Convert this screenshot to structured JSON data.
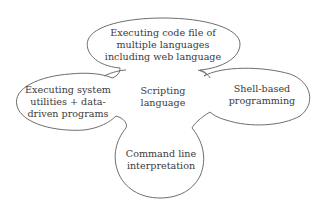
{
  "diagram": {
    "type": "cloud-concept-map",
    "center": {
      "lines": [
        "Scripting",
        "language"
      ]
    },
    "petals": [
      {
        "id": "top",
        "lines": [
          "Executing code file of",
          "multiple languages",
          "including web language"
        ]
      },
      {
        "id": "left",
        "lines": [
          "Executing system",
          "utilities + data-",
          "driven programs"
        ]
      },
      {
        "id": "right",
        "lines": [
          "Shell-based",
          "programming"
        ]
      },
      {
        "id": "bottom",
        "lines": [
          "Command line",
          "interpretation"
        ]
      }
    ],
    "colors": {
      "outline": "#6e6e6e",
      "text": "#3a3a3a",
      "background": "#ffffff"
    }
  }
}
